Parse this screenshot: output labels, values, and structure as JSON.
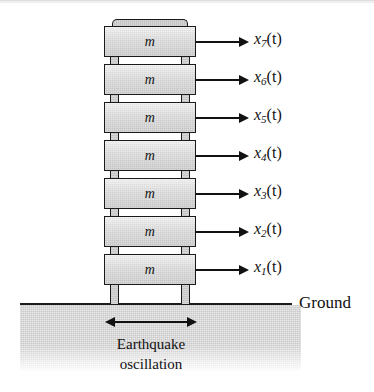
{
  "figure": {
    "name": "seven-story-building-earthquake-model",
    "mass_label": "m",
    "ground_label": "Ground",
    "caption_line1": "Earthquake",
    "caption_line2": "oscillation",
    "colors": {
      "outline": "#1a1a1a",
      "mass_fill": "#cfcfcf",
      "ground_fill": "#c9c9c9",
      "arrow": "#121212",
      "background": "#ffffff"
    },
    "stories": [
      {
        "index": 7,
        "mass": "m",
        "disp_symbol": "x",
        "disp_subscript": "7",
        "disp_arg": "(t)"
      },
      {
        "index": 6,
        "mass": "m",
        "disp_symbol": "x",
        "disp_subscript": "6",
        "disp_arg": "(t)"
      },
      {
        "index": 5,
        "mass": "m",
        "disp_symbol": "x",
        "disp_subscript": "5",
        "disp_arg": "(t)"
      },
      {
        "index": 4,
        "mass": "m",
        "disp_symbol": "x",
        "disp_subscript": "4",
        "disp_arg": "(t)"
      },
      {
        "index": 3,
        "mass": "m",
        "disp_symbol": "x",
        "disp_subscript": "3",
        "disp_arg": "(t)"
      },
      {
        "index": 2,
        "mass": "m",
        "disp_symbol": "x",
        "disp_subscript": "2",
        "disp_arg": "(t)"
      },
      {
        "index": 1,
        "mass": "m",
        "disp_symbol": "x",
        "disp_subscript": "1",
        "disp_arg": "(t)"
      }
    ]
  }
}
